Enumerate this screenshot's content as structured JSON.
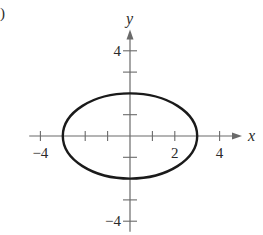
{
  "panel_label": ")",
  "chart_data": {
    "type": "line",
    "title": "",
    "xlabel": "x",
    "ylabel": "y",
    "xlim": [
      -4.5,
      5
    ],
    "ylim": [
      -4.5,
      5
    ],
    "x_ticks": [
      -4,
      -3,
      -2,
      -1,
      1,
      2,
      3,
      4
    ],
    "y_ticks": [
      -4,
      -3,
      -2,
      -1,
      1,
      2,
      3,
      4
    ],
    "x_tick_labels": [
      {
        "value": -4,
        "label": "−4"
      },
      {
        "value": 2,
        "label": "2"
      },
      {
        "value": 4,
        "label": "4"
      }
    ],
    "y_tick_labels": [
      {
        "value": 4,
        "label": "4"
      },
      {
        "value": -4,
        "label": "−4"
      }
    ],
    "grid": false,
    "series": [
      {
        "name": "ellipse",
        "shape": "ellipse",
        "center": [
          0,
          0
        ],
        "semi_major_x": 3,
        "semi_minor_y": 2,
        "equation": "x^2/9 + y^2/4 = 1",
        "color": "#1a1a1a"
      }
    ]
  },
  "layout": {
    "origin_px": [
      130,
      136
    ],
    "unit_x_px": 22.4,
    "unit_y_px": 21.3
  }
}
